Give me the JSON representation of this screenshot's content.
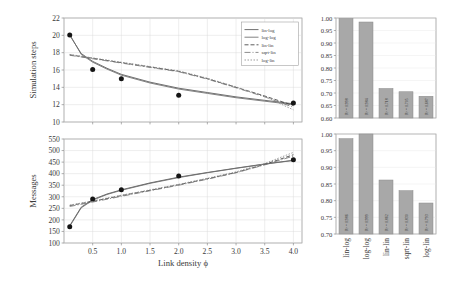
{
  "figure": {
    "title": "",
    "background": "#ffffff",
    "panels": [
      "simulation-steps-vs-link-density",
      "messages-vs-link-density",
      "r2-simulation-steps",
      "r2-messages"
    ]
  },
  "colors": {
    "bar_fill": "#a8a8a8",
    "bar_stroke": "#8a8a8a",
    "point": "#151515",
    "grid": "#d8d8d8",
    "frame": "#8e8e8e",
    "curve_lin_log": "#555555",
    "curve_log_log": "#6b6b6b",
    "curve_lin_lin": "#3f3f3f",
    "curve_sqrt_lin": "#777777",
    "curve_log_lin": "#8c8c8c"
  },
  "legend": {
    "position": "top-right-of-upper-panel",
    "entries": [
      {
        "label": "lin-log",
        "dash": "none"
      },
      {
        "label": "log-log",
        "dash": "none"
      },
      {
        "label": "lin-lin",
        "dash": "4 2"
      },
      {
        "label": "sqrt-lin",
        "dash": "6 2 1 2"
      },
      {
        "label": "log-lin",
        "dash": "1.5 1.5"
      }
    ]
  },
  "chart_data": [
    {
      "id": "simulation-steps-vs-link-density",
      "type": "scatter",
      "title": "",
      "xlabel": "Link density ϕ",
      "ylabel": "Simulation steps",
      "xlim": [
        0.0,
        4.15
      ],
      "ylim": [
        10,
        22
      ],
      "xticks": [
        0.5,
        1.0,
        1.5,
        2.0,
        2.5,
        3.0,
        3.5,
        4.0
      ],
      "xticklabels": [
        "0.5",
        "1.0",
        "1.5",
        "2.0",
        "2.5",
        "3.0",
        "3.5",
        "4.0"
      ],
      "yticks": [
        10,
        12,
        14,
        16,
        18,
        20,
        22
      ],
      "yticklabels": [
        "10",
        "12",
        "14",
        "16",
        "18",
        "20",
        "22"
      ],
      "grid": true,
      "legend": true,
      "points": {
        "x": [
          0.1,
          0.5,
          1.0,
          2.0,
          4.0
        ],
        "y": [
          20.05,
          16.05,
          15.0,
          13.1,
          12.2
        ]
      },
      "series": [
        {
          "name": "lin-log",
          "x": [
            0.1,
            0.3,
            0.5,
            0.75,
            1.0,
            1.5,
            2.0,
            2.5,
            3.0,
            3.5,
            4.0
          ],
          "y": [
            20.0,
            17.9,
            17.0,
            16.2,
            15.5,
            14.6,
            13.9,
            13.4,
            12.9,
            12.5,
            12.1
          ]
        },
        {
          "name": "log-log",
          "x": [
            0.1,
            0.3,
            0.5,
            0.75,
            1.0,
            1.5,
            2.0,
            2.5,
            3.0,
            3.5,
            4.0
          ],
          "y": [
            20.1,
            17.8,
            16.9,
            16.1,
            15.4,
            14.5,
            13.8,
            13.3,
            12.8,
            12.4,
            12.0
          ]
        },
        {
          "name": "lin-lin",
          "x": [
            0.1,
            0.5,
            1.0,
            1.5,
            2.0,
            2.5,
            3.0,
            3.5,
            4.0
          ],
          "y": [
            17.75,
            17.35,
            16.85,
            16.35,
            15.85,
            15.0,
            14.0,
            13.0,
            11.9
          ]
        },
        {
          "name": "sqrt-lin",
          "x": [
            0.1,
            0.5,
            1.0,
            1.5,
            2.0,
            2.5,
            3.0,
            3.5,
            4.0
          ],
          "y": [
            17.7,
            17.3,
            16.8,
            16.3,
            15.8,
            14.95,
            13.95,
            12.9,
            11.7
          ]
        },
        {
          "name": "log-lin",
          "x": [
            0.1,
            0.5,
            1.0,
            1.5,
            2.0,
            2.5,
            3.0,
            3.5,
            4.0
          ],
          "y": [
            17.8,
            17.4,
            16.9,
            16.4,
            15.9,
            15.05,
            14.05,
            12.95,
            11.4
          ]
        }
      ]
    },
    {
      "id": "messages-vs-link-density",
      "type": "scatter",
      "title": "",
      "xlabel": "Link density ϕ",
      "ylabel": "Messages",
      "xlim": [
        0.0,
        4.15
      ],
      "ylim": [
        100,
        550
      ],
      "xticks": [
        0.5,
        1.0,
        1.5,
        2.0,
        2.5,
        3.0,
        3.5,
        4.0
      ],
      "xticklabels": [
        "0.5",
        "1.0",
        "1.5",
        "2.0",
        "2.5",
        "3.0",
        "3.5",
        "4.0"
      ],
      "yticks": [
        100,
        150,
        200,
        250,
        300,
        350,
        400,
        450,
        500,
        550
      ],
      "yticklabels": [
        "100",
        "150",
        "200",
        "250",
        "300",
        "350",
        "400",
        "450",
        "500",
        "550"
      ],
      "grid": true,
      "legend": false,
      "points": {
        "x": [
          0.1,
          0.5,
          1.0,
          2.0,
          4.0
        ],
        "y": [
          170,
          290,
          330,
          390,
          460
        ]
      },
      "series": [
        {
          "name": "lin-log",
          "x": [
            0.1,
            0.3,
            0.5,
            0.75,
            1.0,
            1.5,
            2.0,
            2.5,
            3.0,
            3.5,
            4.0
          ],
          "y": [
            175,
            255,
            288,
            312,
            330,
            360,
            385,
            405,
            424,
            442,
            458
          ]
        },
        {
          "name": "log-log",
          "x": [
            0.1,
            0.3,
            0.5,
            0.75,
            1.0,
            1.5,
            2.0,
            2.5,
            3.0,
            3.5,
            4.0
          ],
          "y": [
            172,
            252,
            285,
            310,
            328,
            358,
            383,
            404,
            423,
            441,
            457
          ]
        },
        {
          "name": "lin-lin",
          "x": [
            0.1,
            0.5,
            1.0,
            1.5,
            2.0,
            2.5,
            3.0,
            3.5,
            4.0
          ],
          "y": [
            262,
            280,
            305,
            328,
            352,
            378,
            405,
            440,
            482
          ]
        },
        {
          "name": "sqrt-lin",
          "x": [
            0.1,
            0.5,
            1.0,
            1.5,
            2.0,
            2.5,
            3.0,
            3.5,
            4.0
          ],
          "y": [
            258,
            277,
            302,
            326,
            350,
            376,
            404,
            438,
            476
          ]
        },
        {
          "name": "log-lin",
          "x": [
            0.1,
            0.5,
            1.0,
            1.5,
            2.0,
            2.5,
            3.0,
            3.5,
            4.0
          ],
          "y": [
            264,
            282,
            307,
            330,
            354,
            380,
            408,
            444,
            492
          ]
        }
      ]
    },
    {
      "id": "r2-simulation-steps",
      "type": "bar",
      "title": "",
      "xlabel": "",
      "ylabel": "",
      "ylim": [
        0.6,
        1.0
      ],
      "yticks": [
        0.6,
        0.65,
        0.7,
        0.75,
        0.8,
        0.85,
        0.9,
        0.95,
        1.0
      ],
      "yticklabels": [
        "0.60",
        "0.65",
        "0.70",
        "0.75",
        "0.80",
        "0.85",
        "0.90",
        "0.95",
        "1.00"
      ],
      "grid": true,
      "show_xticklabels": false,
      "categories": [
        "lin-log",
        "log-log",
        "lin-lin",
        "sqrt-lin",
        "log-lin"
      ],
      "values": [
        0.998,
        0.984,
        0.718,
        0.705,
        0.687
      ],
      "bar_labels": [
        "R² = 0.998",
        "R² = 0.984",
        "R² = 0.718",
        "R² = 0.705",
        "R² = 0.687"
      ]
    },
    {
      "id": "r2-messages",
      "type": "bar",
      "title": "",
      "xlabel": "",
      "ylabel": "",
      "ylim": [
        0.7,
        1.0
      ],
      "yticks": [
        0.7,
        0.75,
        0.8,
        0.85,
        0.9,
        0.95,
        1.0
      ],
      "yticklabels": [
        "0.70",
        "0.75",
        "0.80",
        "0.85",
        "0.90",
        "0.95",
        "1.00"
      ],
      "grid": true,
      "show_xticklabels": true,
      "categories": [
        "lin-log",
        "log-log",
        "lin-lin",
        "sqrt-lin",
        "log-lin"
      ],
      "values": [
        0.986,
        1.0,
        0.862,
        0.83,
        0.793
      ],
      "bar_labels": [
        "R² = 0.986",
        "R² = 0.999",
        "R² = 0.862",
        "R² = 0.830",
        "R² = 0.793"
      ]
    }
  ]
}
